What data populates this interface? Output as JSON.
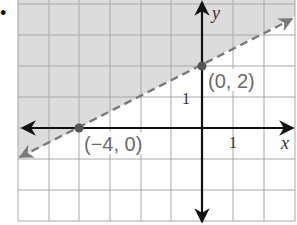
{
  "bullet": "•",
  "graph": {
    "x_axis_label": "x",
    "y_axis_label": "y",
    "x_tick_label": "1",
    "y_tick_label": "1",
    "points": [
      {
        "label": "(−4, 0)",
        "x": -4,
        "y": 0
      },
      {
        "label": "(0, 2)",
        "x": 0,
        "y": 2
      }
    ],
    "boundary_line": {
      "equation": "y = 1/2 x + 2",
      "style": "dashed"
    },
    "shaded_region": "above the line",
    "grid": {
      "x_range": [
        -6,
        3
      ],
      "y_range": [
        -3,
        4
      ]
    }
  },
  "colors": {
    "shade": "#dcdcdc",
    "grid": "#a8a8a8",
    "axis": "#111111",
    "dashed_line": "#7a7a7a",
    "point": "#555555",
    "label": "#6b6b6b"
  }
}
